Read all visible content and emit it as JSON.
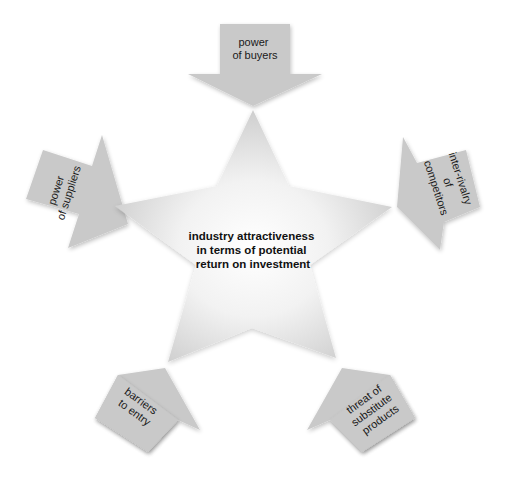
{
  "diagram": {
    "center": {
      "lines": [
        "industry attractiveness",
        "in terms of potential",
        "return on investment"
      ]
    },
    "forces": [
      {
        "id": "top",
        "lines": [
          "power",
          "of buyers"
        ]
      },
      {
        "id": "left",
        "lines": [
          "power",
          "of suppliers"
        ]
      },
      {
        "id": "right",
        "lines": [
          "inter-rivalry",
          "of",
          "competitors"
        ]
      },
      {
        "id": "bottom-left",
        "lines": [
          "barriers",
          "to entry"
        ]
      },
      {
        "id": "bottom-right",
        "lines": [
          "threat of",
          "substitute",
          "products"
        ]
      }
    ],
    "colors": {
      "arrow_fill": "#c9c9c9",
      "star_gradient_center": "#ffffff",
      "star_gradient_edge": "#cdcdcd",
      "text": "#111111"
    }
  }
}
